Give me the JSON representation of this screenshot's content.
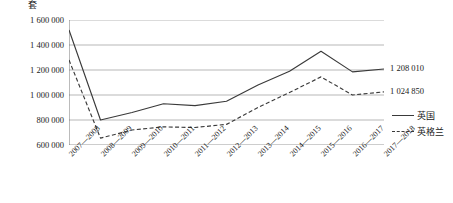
{
  "chart_data": {
    "type": "line",
    "title": "",
    "subtitle": "",
    "xlabel": "",
    "ylabel": "套",
    "unit_label": "套",
    "categories": [
      "2007—2008",
      "2008—2009",
      "2009—2010",
      "2010—2011",
      "2011—2012",
      "2012—2013",
      "2013—2014",
      "2014—2015",
      "2015—2016",
      "2016—2017",
      "2017—2018"
    ],
    "ylim": [
      600000,
      1600000
    ],
    "yticks": [
      600000,
      800000,
      1000000,
      1200000,
      1400000,
      1600000
    ],
    "ytick_labels": [
      "600 000",
      "800 000",
      "1 000 000",
      "1 200 000",
      "1 400 000",
      "1 600 000"
    ],
    "grid": true,
    "grid_axis": "y",
    "legend_position": "right",
    "series": [
      {
        "name": "英国",
        "style": "solid",
        "color": "#3a3a3a",
        "values": [
          1520000,
          800000,
          860000,
          930000,
          915000,
          950000,
          1080000,
          1190000,
          1350000,
          1185000,
          1208010
        ],
        "end_label": "1 208 010"
      },
      {
        "name": "英格兰",
        "style": "dashed",
        "color": "#3a3a3a",
        "values": [
          1280000,
          655000,
          720000,
          745000,
          740000,
          765000,
          900000,
          1020000,
          1145000,
          1000000,
          1024850
        ]
      }
    ],
    "annotations": [
      {
        "text": "1 208 010",
        "series": "英国",
        "category": "2017—2018"
      },
      {
        "text": "1 024 850",
        "series": "英格兰",
        "category": "2017—2018"
      }
    ]
  },
  "legend": {
    "items": [
      {
        "label": "英国",
        "style": "solid"
      },
      {
        "label": "英格兰",
        "style": "dashed"
      }
    ]
  }
}
